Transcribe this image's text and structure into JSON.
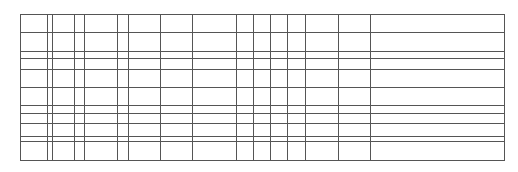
{
  "grid": {
    "description": "Empty ruled table grid with no legible content",
    "left": 20,
    "top": 14,
    "right": 504,
    "bottom": 160,
    "vertical_lines": [
      20,
      47,
      52,
      74,
      84,
      117,
      128,
      160,
      192,
      236,
      253,
      270,
      287,
      305,
      338,
      370,
      504
    ],
    "horizontal_lines": [
      14,
      32,
      51,
      58,
      69,
      87,
      105,
      113,
      123,
      136,
      141,
      160
    ],
    "line_color": "#555555"
  }
}
